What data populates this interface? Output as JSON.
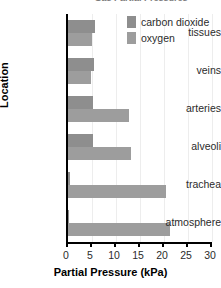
{
  "chart_data": {
    "type": "bar",
    "orientation": "horizontal",
    "title": "Gas Partial Pressures",
    "xlabel": "Partial Pressure (kPa)",
    "ylabel": "Location",
    "xlim": [
      0,
      30
    ],
    "xticks": [
      0,
      5,
      10,
      15,
      20,
      25,
      30
    ],
    "grid": true,
    "legend_position": "top-right",
    "categories": [
      "tissues",
      "veins",
      "arteries",
      "alveoli",
      "trachea",
      "atmosphere"
    ],
    "series": [
      {
        "name": "carbon dioxide",
        "color": "#8e8e8e",
        "values": [
          5.6,
          5.5,
          5.3,
          5.3,
          0.5,
          0.04
        ]
      },
      {
        "name": "oxygen",
        "color": "#9d9d9d",
        "values": [
          5.0,
          4.8,
          12.7,
          13.2,
          20.4,
          21.2
        ]
      }
    ]
  },
  "legend": {
    "items": [
      {
        "label": "carbon dioxide"
      },
      {
        "label": "oxygen"
      }
    ]
  },
  "axes": {
    "x_title": "Partial Pressure (kPa)",
    "y_title": "Location",
    "x_tick_labels": [
      "0",
      "5",
      "10",
      "15",
      "20",
      "25",
      "30"
    ],
    "y_tick_labels": [
      "tissues",
      "veins",
      "arteries",
      "alveoli",
      "trachea",
      "atmosphere"
    ]
  }
}
